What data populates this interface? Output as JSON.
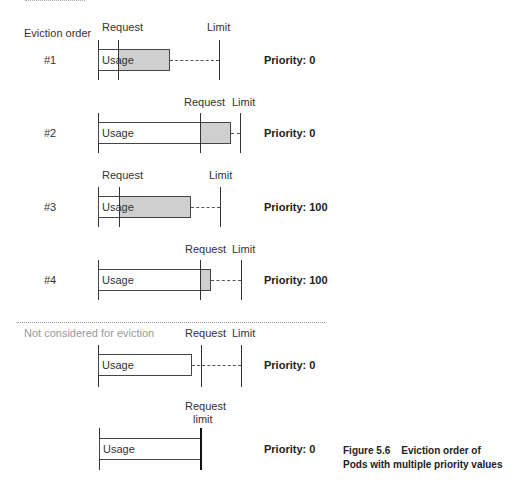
{
  "header": {
    "eviction_order_label": "Eviction order"
  },
  "rows": [
    {
      "order": "#1",
      "request_label": "Request",
      "limit_label": "Limit",
      "usage_label": "Usage",
      "priority": "Priority: 0"
    },
    {
      "order": "#2",
      "request_label": "Request",
      "limit_label": "Limit",
      "usage_label": "Usage",
      "priority": "Priority: 0"
    },
    {
      "order": "#3",
      "request_label": "Request",
      "limit_label": "Limit",
      "usage_label": "Usage",
      "priority": "Priority: 100"
    },
    {
      "order": "#4",
      "request_label": "Request",
      "limit_label": "Limit",
      "usage_label": "Usage",
      "priority": "Priority: 100"
    },
    {
      "order": "",
      "request_label": "Request",
      "limit_label": "Limit",
      "usage_label": "Usage",
      "priority": "Priority: 0"
    },
    {
      "order": "",
      "request_label": "Request",
      "limit_label": "limit",
      "usage_label": "Usage",
      "priority": "Priority: 0"
    }
  ],
  "divider": {
    "label": "Not considered for eviction"
  },
  "caption": {
    "line1": "Figure 5.6    Eviction order of",
    "line2": "Pods with multiple priority values"
  },
  "colors": {
    "fill": "#cfcfcf",
    "line": "#333333",
    "muted": "#999999"
  }
}
